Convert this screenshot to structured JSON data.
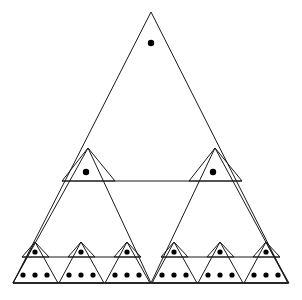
{
  "figure": {
    "stroke_color": "#1a1a1a",
    "dot_color": "#000000",
    "background_color": "#ffffff",
    "stroke_width": 1,
    "dot_radius": 3.2,
    "small_dot_radius": 2.6,
    "canvas": {
      "width": 302,
      "height": 300
    }
  },
  "chart_data": {
    "type": "diagram",
    "levels": [
      {
        "level": 1,
        "triangles": 1,
        "dots_per_triangle": 1,
        "total_dots": 1
      },
      {
        "level": 2,
        "triangles": 2,
        "dots_per_triangle": 1,
        "total_dots": 2
      },
      {
        "level": 3,
        "triangles": 6,
        "dots_per_triangle": 1,
        "total_dots": 6
      },
      {
        "level": 4,
        "triangles": 6,
        "dots_per_triangle": 3,
        "total_dots": 18
      }
    ],
    "total_dots": 27,
    "xlabel": "",
    "ylabel": ""
  },
  "geometry": {
    "outer_triangle": {
      "apex_x": 151,
      "apex_y": 12,
      "left_x": 13,
      "right_x": 288,
      "base_y": 283
    },
    "mid_line_y": 181,
    "lower_line_y": 257,
    "outer_dot": {
      "cx": 151,
      "cy": 43
    },
    "level2_triangles": [
      {
        "apex_x": 88,
        "apex_y": 148,
        "left_x": 62,
        "right_x": 115,
        "base_y": 181,
        "dot_cx": 86,
        "dot_cy": 172
      },
      {
        "apex_x": 215,
        "apex_y": 148,
        "left_x": 189,
        "right_x": 242,
        "base_y": 181,
        "dot_cx": 213,
        "dot_cy": 172
      }
    ],
    "level2_half_triangles": [
      {
        "apex_x": 88,
        "apex_y": 148,
        "left_x": 13,
        "right_x": 151,
        "base_y": 283
      },
      {
        "apex_x": 215,
        "apex_y": 148,
        "left_x": 151,
        "right_x": 288,
        "base_y": 283
      }
    ],
    "level3_triangles": [
      {
        "apex_x": 35,
        "apex_y": 242,
        "left_x": 22,
        "right_x": 49,
        "base_y": 257,
        "dot_cx": 35,
        "dot_cy": 252
      },
      {
        "apex_x": 81,
        "apex_y": 242,
        "left_x": 68,
        "right_x": 95,
        "base_y": 257,
        "dot_cx": 81,
        "dot_cy": 252
      },
      {
        "apex_x": 127,
        "apex_y": 242,
        "left_x": 114,
        "right_x": 141,
        "base_y": 257,
        "dot_cx": 127,
        "dot_cy": 252
      },
      {
        "apex_x": 174,
        "apex_y": 242,
        "left_x": 161,
        "right_x": 188,
        "base_y": 257,
        "dot_cx": 174,
        "dot_cy": 252
      },
      {
        "apex_x": 220,
        "apex_y": 242,
        "left_x": 207,
        "right_x": 234,
        "base_y": 257,
        "dot_cx": 220,
        "dot_cy": 252
      },
      {
        "apex_x": 266,
        "apex_y": 242,
        "left_x": 253,
        "right_x": 280,
        "base_y": 257,
        "dot_cx": 266,
        "dot_cy": 252
      }
    ],
    "level3_half_triangles": [
      {
        "apex_x": 35,
        "apex_y": 242,
        "left_x": 13,
        "right_x": 58,
        "base_y": 283
      },
      {
        "apex_x": 81,
        "apex_y": 242,
        "left_x": 59,
        "right_x": 104,
        "base_y": 283
      },
      {
        "apex_x": 127,
        "apex_y": 242,
        "left_x": 105,
        "right_x": 150,
        "base_y": 283
      },
      {
        "apex_x": 174,
        "apex_y": 242,
        "left_x": 152,
        "right_x": 197,
        "base_y": 283
      },
      {
        "apex_x": 220,
        "apex_y": 242,
        "left_x": 198,
        "right_x": 243,
        "base_y": 283
      },
      {
        "apex_x": 266,
        "apex_y": 242,
        "left_x": 244,
        "right_x": 289,
        "base_y": 283
      }
    ],
    "level4_dot_rows": [
      {
        "cy": 275,
        "cxs": [
          23,
          35,
          47
        ]
      },
      {
        "cy": 275,
        "cxs": [
          69,
          81,
          93
        ]
      },
      {
        "cy": 275,
        "cxs": [
          115,
          127,
          139
        ]
      },
      {
        "cy": 275,
        "cxs": [
          162,
          174,
          186
        ]
      },
      {
        "cy": 275,
        "cxs": [
          208,
          220,
          232
        ]
      },
      {
        "cy": 275,
        "cxs": [
          254,
          266,
          278
        ]
      }
    ],
    "mid_line_segments": [
      {
        "x1": 62,
        "x2": 242,
        "y": 181
      }
    ],
    "lower_line_segments": [
      {
        "x1": 22,
        "x2": 141,
        "y": 257
      },
      {
        "x1": 161,
        "x2": 280,
        "y": 257
      }
    ],
    "baseline": {
      "x1": 13,
      "x2": 289,
      "y": 283
    }
  }
}
